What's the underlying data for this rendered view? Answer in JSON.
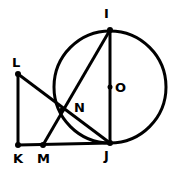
{
  "diagram": {
    "type": "geometry",
    "stroke_color": "#000000",
    "background": "#ffffff",
    "circle": {
      "center": "O",
      "cx": 110,
      "cy": 87,
      "r": 56
    },
    "points": [
      {
        "name": "I",
        "x": 110,
        "y": 30,
        "label_x": 104,
        "label_y": 18
      },
      {
        "name": "O",
        "x": 110,
        "y": 87,
        "label_x": 115,
        "label_y": 92
      },
      {
        "name": "N",
        "x": 62,
        "y": 110,
        "label_x": 74,
        "label_y": 112
      },
      {
        "name": "L",
        "x": 18,
        "y": 74,
        "label_x": 12,
        "label_y": 67
      },
      {
        "name": "K",
        "x": 18,
        "y": 145,
        "label_x": 13,
        "label_y": 163
      },
      {
        "name": "M",
        "x": 43,
        "y": 145,
        "label_x": 37,
        "label_y": 163
      },
      {
        "name": "J",
        "x": 110,
        "y": 143,
        "label_x": 104,
        "label_y": 160
      }
    ],
    "segments": [
      [
        "I",
        "J"
      ],
      [
        "I",
        "M"
      ],
      [
        "L",
        "J"
      ],
      [
        "L",
        "K"
      ],
      [
        "K",
        "J"
      ]
    ]
  }
}
